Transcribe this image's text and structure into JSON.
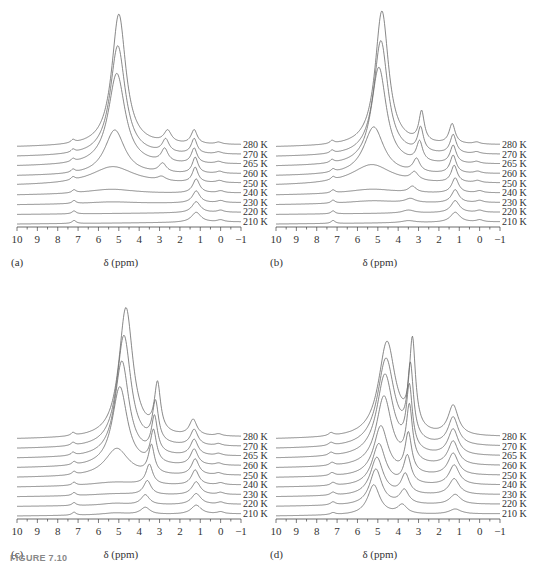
{
  "figure": {
    "caption_partial": "FIGURE 7.10"
  },
  "chart_data": [
    {
      "id": "a",
      "type": "line",
      "panel_label": "(a)",
      "xlabel": "δ (ppm)",
      "ylabel": "",
      "xlim": [
        10,
        -1
      ],
      "x_ticks": [
        "10",
        "9",
        "8",
        "7",
        "6",
        "5",
        "4",
        "3",
        "2",
        "1",
        "0",
        "−1"
      ],
      "stacked_offset": true,
      "series_labels": [
        "280 K",
        "270 K",
        "265 K",
        "260 K",
        "250 K",
        "240 K",
        "230 K",
        "220 K",
        "210 K"
      ],
      "series": [
        {
          "name": "280 K",
          "peaks": [
            [
              5.0,
              132,
              0.42
            ],
            [
              2.6,
              12,
              0.22
            ],
            [
              1.3,
              14,
              0.18
            ],
            [
              7.25,
              3,
              0.12
            ],
            [
              0.1,
              2,
              0.2
            ]
          ]
        },
        {
          "name": "270 K",
          "peaks": [
            [
              5.05,
              110,
              0.45
            ],
            [
              2.7,
              13,
              0.2
            ],
            [
              1.3,
              15,
              0.17
            ],
            [
              7.25,
              3,
              0.12
            ],
            [
              0.1,
              2,
              0.2
            ]
          ]
        },
        {
          "name": "265 K",
          "peaks": [
            [
              5.1,
              92,
              0.5
            ],
            [
              2.75,
              13,
              0.2
            ],
            [
              1.3,
              15,
              0.17
            ],
            [
              7.25,
              3,
              0.12
            ],
            [
              0.1,
              2,
              0.2
            ]
          ]
        },
        {
          "name": "260 K",
          "peaks": [
            [
              5.2,
              45,
              0.6
            ],
            [
              2.85,
              9,
              0.22
            ],
            [
              1.25,
              16,
              0.17
            ],
            [
              7.25,
              3,
              0.12
            ],
            [
              0.05,
              2,
              0.2
            ]
          ]
        },
        {
          "name": "250 K",
          "peaks": [
            [
              5.3,
              18,
              1.3
            ],
            [
              2.9,
              4,
              0.25
            ],
            [
              1.25,
              15,
              0.17
            ],
            [
              7.25,
              3,
              0.12
            ],
            [
              0.05,
              2,
              0.2
            ]
          ]
        },
        {
          "name": "240 K",
          "peaks": [
            [
              5.4,
              5,
              1.5
            ],
            [
              1.2,
              14,
              0.2
            ],
            [
              7.2,
              3,
              0.12
            ],
            [
              0.0,
              2,
              0.2
            ]
          ]
        },
        {
          "name": "230 K",
          "peaks": [
            [
              5.4,
              2,
              1.5
            ],
            [
              1.2,
              12,
              0.22
            ],
            [
              7.2,
              3,
              0.12
            ],
            [
              0.0,
              2,
              0.2
            ]
          ]
        },
        {
          "name": "220 K",
          "peaks": [
            [
              1.2,
              11,
              0.25
            ],
            [
              7.2,
              3,
              0.12
            ],
            [
              0.0,
              2,
              0.2
            ]
          ]
        },
        {
          "name": "210 K",
          "peaks": [
            [
              1.2,
              10,
              0.28
            ],
            [
              7.2,
              3,
              0.12
            ],
            [
              0.0,
              2,
              0.2
            ]
          ]
        }
      ]
    },
    {
      "id": "b",
      "type": "line",
      "panel_label": "(b)",
      "xlabel": "δ (ppm)",
      "ylabel": "",
      "xlim": [
        10,
        -1
      ],
      "x_ticks": [
        "10",
        "9",
        "8",
        "7",
        "6",
        "5",
        "4",
        "3",
        "2",
        "1",
        "0",
        "−1"
      ],
      "stacked_offset": true,
      "series_labels": [
        "280 K",
        "270 K",
        "265 K",
        "260 K",
        "250 K",
        "240 K",
        "230 K",
        "220 K",
        "210 K"
      ],
      "series": [
        {
          "name": "280 K",
          "peaks": [
            [
              4.8,
              135,
              0.4
            ],
            [
              2.85,
              30,
              0.16
            ],
            [
              1.35,
              20,
              0.18
            ],
            [
              7.25,
              3,
              0.12
            ],
            [
              0.15,
              2,
              0.2
            ]
          ]
        },
        {
          "name": "270 K",
          "peaks": [
            [
              4.85,
              115,
              0.42
            ],
            [
              2.9,
              24,
              0.17
            ],
            [
              1.3,
              19,
              0.18
            ],
            [
              7.25,
              3,
              0.12
            ],
            [
              0.15,
              2,
              0.2
            ]
          ]
        },
        {
          "name": "265 K",
          "peaks": [
            [
              4.95,
              98,
              0.45
            ],
            [
              2.95,
              20,
              0.18
            ],
            [
              1.3,
              18,
              0.18
            ],
            [
              7.25,
              3,
              0.12
            ],
            [
              0.15,
              2,
              0.2
            ]
          ]
        },
        {
          "name": "260 K",
          "peaks": [
            [
              5.2,
              48,
              0.6
            ],
            [
              3.1,
              13,
              0.2
            ],
            [
              1.3,
              18,
              0.18
            ],
            [
              7.2,
              3,
              0.12
            ],
            [
              0.1,
              2,
              0.2
            ]
          ]
        },
        {
          "name": "250 K",
          "peaks": [
            [
              5.3,
              20,
              1.2
            ],
            [
              3.2,
              8,
              0.22
            ],
            [
              1.25,
              17,
              0.18
            ],
            [
              7.2,
              3,
              0.12
            ],
            [
              0.1,
              2,
              0.2
            ]
          ]
        },
        {
          "name": "240 K",
          "peaks": [
            [
              5.3,
              5,
              1.5
            ],
            [
              3.3,
              6,
              0.22
            ],
            [
              1.2,
              15,
              0.2
            ],
            [
              7.2,
              3,
              0.12
            ],
            [
              0.0,
              2,
              0.2
            ]
          ]
        },
        {
          "name": "230 K",
          "peaks": [
            [
              5.3,
              3,
              1.5
            ],
            [
              3.4,
              4,
              0.3
            ],
            [
              1.2,
              13,
              0.22
            ],
            [
              7.2,
              3,
              0.12
            ],
            [
              0.0,
              2,
              0.2
            ]
          ]
        },
        {
          "name": "220 K",
          "peaks": [
            [
              3.5,
              3,
              0.35
            ],
            [
              1.2,
              12,
              0.25
            ],
            [
              7.2,
              3,
              0.12
            ],
            [
              0.0,
              2,
              0.2
            ]
          ]
        },
        {
          "name": "210 K",
          "peaks": [
            [
              3.5,
              2,
              0.4
            ],
            [
              1.2,
              10,
              0.28
            ],
            [
              7.2,
              3,
              0.12
            ],
            [
              0.0,
              2,
              0.2
            ]
          ]
        }
      ]
    },
    {
      "id": "c",
      "type": "line",
      "panel_label": "(c)",
      "xlabel": "δ (ppm)",
      "ylabel": "",
      "xlim": [
        10,
        -1
      ],
      "x_ticks": [
        "10",
        "9",
        "8",
        "7",
        "6",
        "5",
        "4",
        "3",
        "2",
        "1",
        "0",
        "−1"
      ],
      "stacked_offset": true,
      "series_labels": [
        "280 K",
        "270 K",
        "265 K",
        "260 K",
        "250 K",
        "240 K",
        "230 K",
        "220 K",
        "210 K"
      ],
      "series": [
        {
          "name": "280 K",
          "peaks": [
            [
              4.65,
              130,
              0.42
            ],
            [
              3.1,
              48,
              0.18
            ],
            [
              1.35,
              16,
              0.22
            ],
            [
              7.25,
              3,
              0.12
            ],
            [
              0.1,
              2,
              0.2
            ]
          ]
        },
        {
          "name": "270 K",
          "peaks": [
            [
              4.75,
              112,
              0.42
            ],
            [
              3.2,
              40,
              0.18
            ],
            [
              1.3,
              16,
              0.22
            ],
            [
              7.25,
              3,
              0.12
            ],
            [
              0.1,
              2,
              0.2
            ]
          ]
        },
        {
          "name": "265 K",
          "peaks": [
            [
              4.85,
              96,
              0.42
            ],
            [
              3.25,
              36,
              0.18
            ],
            [
              1.3,
              16,
              0.22
            ],
            [
              7.25,
              3,
              0.12
            ],
            [
              0.1,
              2,
              0.2
            ]
          ]
        },
        {
          "name": "260 K",
          "peaks": [
            [
              4.95,
              80,
              0.45
            ],
            [
              3.3,
              32,
              0.18
            ],
            [
              1.3,
              16,
              0.22
            ],
            [
              7.2,
              3,
              0.12
            ],
            [
              0.1,
              2,
              0.2
            ]
          ]
        },
        {
          "name": "250 K",
          "peaks": [
            [
              5.1,
              28,
              0.7
            ],
            [
              3.4,
              28,
              0.18
            ],
            [
              1.25,
              16,
              0.22
            ],
            [
              7.2,
              3,
              0.12
            ],
            [
              0.1,
              2,
              0.2
            ]
          ]
        },
        {
          "name": "240 K",
          "peaks": [
            [
              5.2,
              4,
              1.5
            ],
            [
              3.5,
              20,
              0.2
            ],
            [
              1.25,
              15,
              0.22
            ],
            [
              7.2,
              3,
              0.12
            ],
            [
              0.0,
              2,
              0.2
            ]
          ]
        },
        {
          "name": "230 K",
          "peaks": [
            [
              5.2,
              2,
              1.5
            ],
            [
              3.6,
              14,
              0.22
            ],
            [
              1.2,
              13,
              0.25
            ],
            [
              7.2,
              3,
              0.12
            ],
            [
              0.0,
              2,
              0.2
            ]
          ]
        },
        {
          "name": "220 K",
          "peaks": [
            [
              5.2,
              2,
              0.8
            ],
            [
              3.7,
              10,
              0.25
            ],
            [
              1.2,
              11,
              0.28
            ],
            [
              7.2,
              3,
              0.12
            ],
            [
              0.0,
              2,
              0.2
            ]
          ]
        },
        {
          "name": "210 K",
          "peaks": [
            [
              5.2,
              2,
              0.8
            ],
            [
              3.7,
              7,
              0.28
            ],
            [
              1.2,
              9,
              0.3
            ],
            [
              7.2,
              3,
              0.12
            ],
            [
              0.0,
              2,
              0.2
            ]
          ]
        }
      ]
    },
    {
      "id": "d",
      "type": "line",
      "panel_label": "(d)",
      "xlabel": "δ (ppm)",
      "ylabel": "",
      "xlim": [
        10,
        -1
      ],
      "x_ticks": [
        "10",
        "9",
        "8",
        "7",
        "6",
        "5",
        "4",
        "3",
        "2",
        "1",
        "0",
        "−1"
      ],
      "stacked_offset": true,
      "series_labels": [
        "280 K",
        "270 K",
        "265 K",
        "260 K",
        "250 K",
        "240 K",
        "230 K",
        "220 K",
        "210 K"
      ],
      "series": [
        {
          "name": "280 K",
          "peaks": [
            [
              4.55,
              95,
              0.5
            ],
            [
              3.3,
              88,
              0.18
            ],
            [
              1.3,
              30,
              0.3
            ],
            [
              7.3,
              3,
              0.15
            ]
          ]
        },
        {
          "name": "270 K",
          "peaks": [
            [
              4.6,
              88,
              0.5
            ],
            [
              3.4,
              72,
              0.18
            ],
            [
              1.3,
              28,
              0.3
            ],
            [
              7.3,
              3,
              0.15
            ]
          ]
        },
        {
          "name": "265 K",
          "peaks": [
            [
              4.65,
              82,
              0.48
            ],
            [
              3.45,
              62,
              0.18
            ],
            [
              1.3,
              26,
              0.3
            ],
            [
              7.3,
              3,
              0.15
            ]
          ]
        },
        {
          "name": "260 K",
          "peaks": [
            [
              4.7,
              70,
              0.45
            ],
            [
              3.45,
              55,
              0.18
            ],
            [
              1.3,
              24,
              0.3
            ],
            [
              7.25,
              3,
              0.15
            ]
          ]
        },
        {
          "name": "250 K",
          "peaks": [
            [
              4.85,
              50,
              0.42
            ],
            [
              3.5,
              40,
              0.2
            ],
            [
              1.3,
              22,
              0.3
            ],
            [
              7.25,
              3,
              0.15
            ]
          ]
        },
        {
          "name": "240 K",
          "peaks": [
            [
              4.95,
              42,
              0.4
            ],
            [
              3.55,
              28,
              0.22
            ],
            [
              1.25,
              20,
              0.3
            ],
            [
              7.2,
              3,
              0.15
            ]
          ]
        },
        {
          "name": "230 K",
          "peaks": [
            [
              5.05,
              38,
              0.38
            ],
            [
              3.65,
              20,
              0.24
            ],
            [
              1.25,
              16,
              0.3
            ],
            [
              7.2,
              3,
              0.15
            ]
          ]
        },
        {
          "name": "220 K",
          "peaks": [
            [
              5.1,
              36,
              0.36
            ],
            [
              3.7,
              14,
              0.26
            ],
            [
              1.2,
              10,
              0.32
            ],
            [
              7.2,
              3,
              0.15
            ]
          ]
        },
        {
          "name": "210 K",
          "peaks": [
            [
              5.2,
              30,
              0.36
            ],
            [
              3.8,
              9,
              0.28
            ],
            [
              1.2,
              5,
              0.35
            ],
            [
              7.2,
              2,
              0.15
            ]
          ]
        }
      ]
    }
  ],
  "layout": {
    "panels": [
      {
        "id": "a",
        "left": 0,
        "top": 0
      },
      {
        "id": "b",
        "left": 259,
        "top": 0
      },
      {
        "id": "c",
        "left": 0,
        "top": 292
      },
      {
        "id": "d",
        "left": 259,
        "top": 292
      }
    ],
    "line_color": "#6a6a6a",
    "axis_color": "#444444"
  }
}
